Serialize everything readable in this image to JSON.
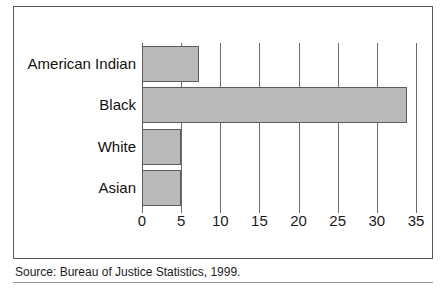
{
  "source_note": "Source: Bureau of Justice Statistics, 1999.",
  "chart_data": {
    "type": "bar",
    "orientation": "horizontal",
    "title": "",
    "subtitle": "",
    "xlabel": "",
    "ylabel": "",
    "categories": [
      "American Indian",
      "Black",
      "White",
      "Asian"
    ],
    "values": [
      7.3,
      33.9,
      5.0,
      5.0
    ],
    "xlim": [
      0,
      35
    ],
    "xticks": [
      0,
      5,
      10,
      15,
      20,
      25,
      30,
      35
    ],
    "xticklabels": [
      "0",
      "5",
      "10",
      "15",
      "20",
      "25",
      "30",
      "35"
    ],
    "grid": "vertical-only",
    "legend": "none",
    "bar_fill_color": "#b9b9b9",
    "bar_border_color": "#5d5d5d",
    "gridline_color": "#6a6a6a",
    "frame_color": "#585858",
    "background_color": "#ffffff"
  }
}
